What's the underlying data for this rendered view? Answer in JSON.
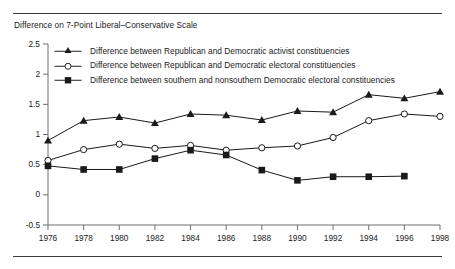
{
  "figure": {
    "axis_title": "Difference on 7-Point Liberal–Conservative Scale"
  },
  "chart_data": {
    "type": "line",
    "title": "Difference on 7-Point Liberal–Conservative Scale",
    "xlabel": "",
    "ylabel": "",
    "xlim": [
      1976,
      1998
    ],
    "ylim": [
      -0.5,
      2.5
    ],
    "yticks": [
      2.5,
      2,
      1.5,
      1,
      0.5,
      0,
      -0.5
    ],
    "ytick_labels": [
      "2.5",
      "2",
      "1.5",
      "1",
      "0.5",
      "0",
      "-0.5"
    ],
    "x": [
      1976,
      1978,
      1980,
      1982,
      1984,
      1986,
      1988,
      1990,
      1992,
      1994,
      1996,
      1998
    ],
    "xtick_labels": [
      "1976",
      "1978",
      "1980",
      "1982",
      "1984",
      "1986",
      "1988",
      "1990",
      "1992",
      "1994",
      "1996",
      "1998"
    ],
    "grid": false,
    "legend_position": "upper-left-inside",
    "series": [
      {
        "name": "Difference between Republican and Democratic activist constituencies",
        "marker": "filled-triangle",
        "color": "#1a1a1a",
        "values": [
          0.9,
          1.23,
          1.29,
          1.19,
          1.34,
          1.32,
          1.24,
          1.39,
          1.37,
          1.66,
          1.6,
          1.71
        ]
      },
      {
        "name": "Difference between Republican and Democratic electoral constituencies",
        "marker": "open-circle",
        "color": "#1a1a1a",
        "values": [
          0.57,
          0.75,
          0.84,
          0.77,
          0.82,
          0.74,
          0.78,
          0.81,
          0.95,
          1.23,
          1.34,
          1.3
        ]
      },
      {
        "name": "Difference between southern and nonsouthern Democratic electoral constituencies",
        "marker": "filled-square",
        "color": "#1a1a1a",
        "values": [
          0.48,
          0.42,
          0.42,
          0.6,
          0.74,
          0.66,
          0.41,
          0.24,
          0.3,
          0.3,
          0.31,
          null
        ]
      }
    ]
  }
}
